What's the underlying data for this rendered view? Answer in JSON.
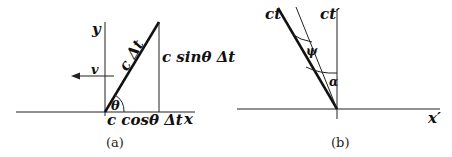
{
  "panel_a": {
    "caption": "(a)",
    "y_axis_label": "y",
    "x_axis_label": "x",
    "velocity_label": "v",
    "hypotenuse_label": "c Δt",
    "vertical_side_label": "c sinθ Δt",
    "horizontal_side_label": "c cosθ Δt",
    "angle_label": "θ"
  },
  "panel_b": {
    "caption": "(b)",
    "ct_label": "ct",
    "ct_prime_label": "ct′",
    "x_prime_label": "x′",
    "angle_psi_label": "ψ",
    "angle_alpha_label": "α"
  }
}
